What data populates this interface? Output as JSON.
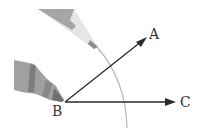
{
  "diagram": {
    "points": {
      "A": {
        "label": "A",
        "x": 150,
        "y": 38
      },
      "B": {
        "label": "B",
        "x": 65,
        "y": 102
      },
      "C": {
        "label": "C",
        "x": 178,
        "y": 102
      }
    },
    "rays": [
      {
        "from": "B",
        "to": "A"
      },
      {
        "from": "B",
        "to": "C"
      }
    ],
    "arc": {
      "center": "B",
      "description": "compass arc crossing both rays"
    },
    "tools": [
      "compass-pencil-tip",
      "compass-needle-leg"
    ],
    "colors": {
      "line": "#2a2a2a",
      "arc": "#b8b8b8",
      "pencil_dark": "#9a9a9a",
      "pencil_light": "#d9d9d9",
      "pen_body": "#8e8e8e"
    }
  }
}
